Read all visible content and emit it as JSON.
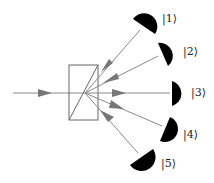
{
  "diagram": {
    "title": "",
    "colors": {
      "ray": "#8a8a8a",
      "arrow": "#777777",
      "splitter": "#666666",
      "detector": "#000000",
      "background": "#ffffff"
    },
    "input_beam": {
      "label": ""
    },
    "beam_splitter": {
      "label": ""
    },
    "detectors": [
      {
        "id": 1,
        "label": "|1⟩",
        "ray_direction": "inward"
      },
      {
        "id": 2,
        "label": "|2⟩",
        "ray_direction": "inward"
      },
      {
        "id": 3,
        "label": "|3⟩",
        "ray_direction": "outward"
      },
      {
        "id": 4,
        "label": "|4⟩",
        "ray_direction": "outward"
      },
      {
        "id": 5,
        "label": "|5⟩",
        "ray_direction": "inward"
      }
    ]
  }
}
